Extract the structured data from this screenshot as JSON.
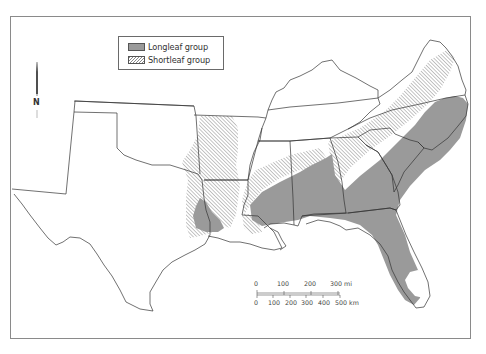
{
  "legend": {
    "items": [
      {
        "label": "Longleaf group",
        "pattern": "solid-gray",
        "color": "#9a9a9a"
      },
      {
        "label": "Shortleaf group",
        "pattern": "diagonal-hatch",
        "color": "#8a8a8a"
      }
    ]
  },
  "north_arrow": {
    "label": "N"
  },
  "scale_bar": {
    "miles": {
      "ticks": [
        "0",
        "100",
        "200",
        "300 mi"
      ]
    },
    "kilometers": {
      "ticks": [
        "0",
        "100",
        "200",
        "300",
        "400",
        "500 km"
      ]
    }
  },
  "colors": {
    "longleaf": "#9a9a9a",
    "shortleaf_hatch": "#8a8a8a",
    "state_border": "#333333",
    "frame": "#8a8a8a"
  },
  "regions": [
    "Texas",
    "New Mexico (part)",
    "Oklahoma",
    "Arkansas",
    "Louisiana",
    "Mississippi",
    "Alabama",
    "Georgia",
    "Florida",
    "South Carolina",
    "North Carolina",
    "Tennessee",
    "Kentucky",
    "Virginia"
  ]
}
